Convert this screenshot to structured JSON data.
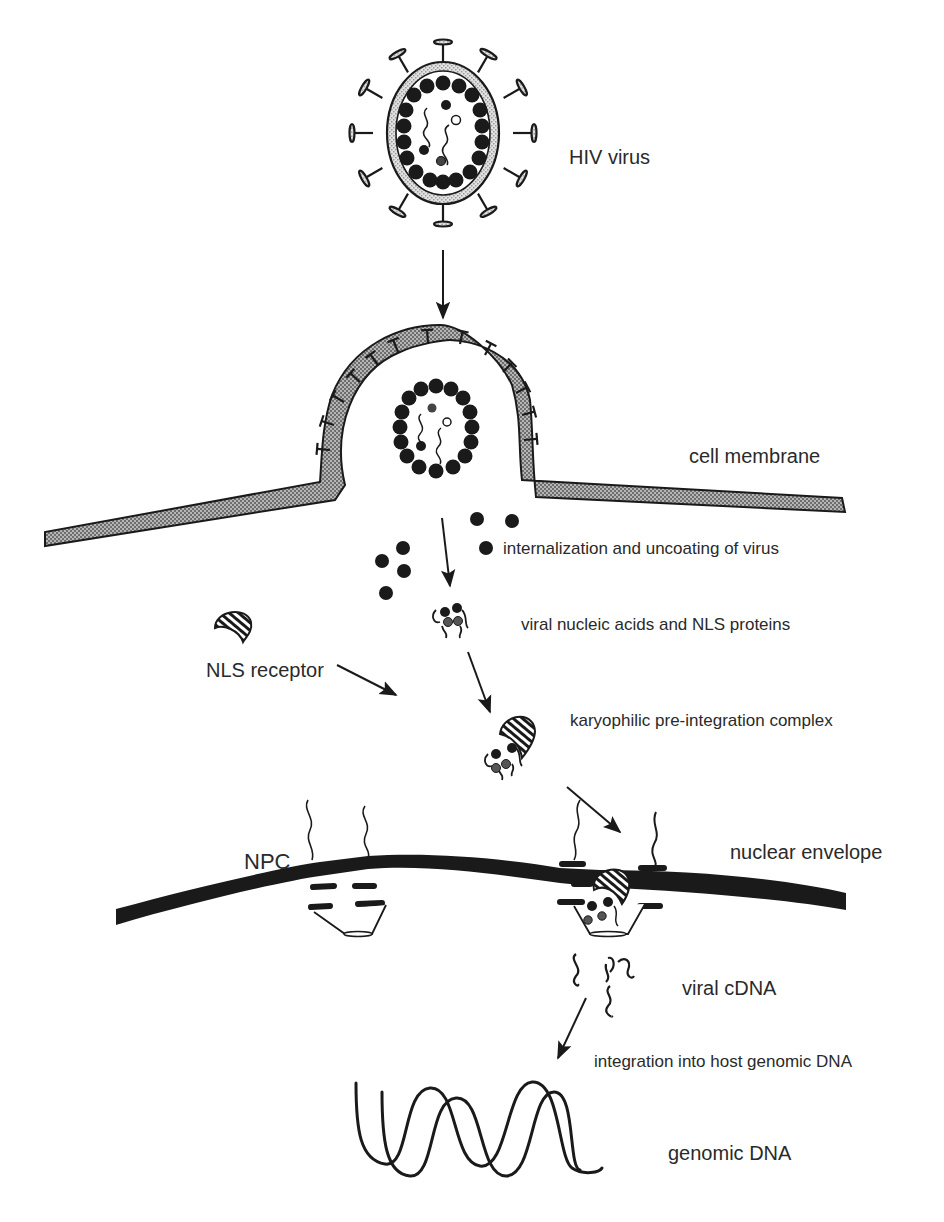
{
  "diagram": {
    "type": "process-flow",
    "colors": {
      "background": "#ffffff",
      "ink": "#1a1a1a",
      "membrane_fill": "#9a9a9a",
      "viral_shell": "#cfcfcf",
      "text": "#2a2a2a"
    },
    "labels": {
      "hiv_virus": "HIV virus",
      "cell_membrane": "cell membrane",
      "internalization": "internalization and uncoating of virus",
      "viral_nucleic_acids": "viral nucleic acids and NLS proteins",
      "nls_receptor": "NLS receptor",
      "karyophilic_complex": "karyophilic pre-integration complex",
      "npc": "NPC",
      "nuclear_envelope": "nuclear envelope",
      "viral_cdna": "viral cDNA",
      "integration": "integration into host genomic DNA",
      "genomic_dna": "genomic DNA"
    },
    "steps": [
      "HIV virus",
      "cell membrane",
      "internalization and uncoating of virus",
      "viral nucleic acids and NLS proteins",
      "karyophilic pre-integration complex",
      "nuclear envelope",
      "viral cDNA",
      "integration into host genomic DNA",
      "genomic DNA"
    ]
  }
}
